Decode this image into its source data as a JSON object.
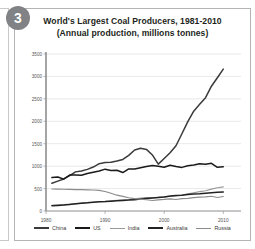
{
  "badge": {
    "number": "3"
  },
  "title": {
    "line1": "World's Largest Coal Producers, 1981-2010",
    "line2": "(Annual production, millions tonnes)"
  },
  "chart_data": {
    "type": "line",
    "title": "World's Largest Coal Producers, 1981-2010",
    "subtitle": "(Annual production, millions tonnes)",
    "xlabel": "",
    "ylabel": "",
    "xlim": [
      1980,
      2013
    ],
    "ylim": [
      0,
      3500
    ],
    "grid": true,
    "legend_position": "bottom",
    "xticks": [
      1980,
      1990,
      2000,
      2010
    ],
    "xtick_labels": [
      "1980",
      "1990",
      "2000",
      "2010"
    ],
    "yticks": [
      0,
      500,
      1000,
      1500,
      2000,
      2500,
      3000,
      3500
    ],
    "ytick_labels": [
      "0",
      "500",
      "1000",
      "1500",
      "2000",
      "2500",
      "3000",
      "3500"
    ],
    "x": [
      1981,
      1982,
      1983,
      1984,
      1985,
      1986,
      1987,
      1988,
      1989,
      1990,
      1991,
      1992,
      1993,
      1994,
      1995,
      1996,
      1997,
      1998,
      1999,
      2000,
      2001,
      2002,
      2003,
      2004,
      2005,
      2006,
      2007,
      2008,
      2009,
      2010
    ],
    "series": [
      {
        "name": "China",
        "color": "#3a3a3a",
        "width": 1.5,
        "values": [
          620,
          666,
          715,
          789,
          872,
          894,
          928,
          980,
          1054,
          1080,
          1087,
          1116,
          1150,
          1240,
          1361,
          1397,
          1373,
          1250,
          1045,
          1171,
          1300,
          1455,
          1722,
          1992,
          2226,
          2380,
          2526,
          2782,
          2971,
          3162
        ]
      },
      {
        "name": "US",
        "color": "#1a1a1a",
        "width": 1.5,
        "values": [
          745,
          757,
          710,
          801,
          801,
          797,
          834,
          862,
          890,
          933,
          904,
          907,
          857,
          938,
          937,
          964,
          990,
          1012,
          1000,
          974,
          1021,
          991,
          972,
          1008,
          1027,
          1053,
          1040,
          1063,
          975,
          984
        ]
      },
      {
        "name": "India",
        "color": "#9a9a9a",
        "width": 1.2,
        "values": [
          128,
          135,
          144,
          152,
          161,
          176,
          187,
          195,
          206,
          211,
          226,
          240,
          248,
          256,
          273,
          286,
          299,
          296,
          302,
          313,
          323,
          336,
          356,
          383,
          407,
          430,
          452,
          489,
          519,
          538
        ]
      },
      {
        "name": "Australia",
        "color": "#222222",
        "width": 1.5,
        "values": [
          116,
          124,
          132,
          146,
          164,
          174,
          182,
          196,
          205,
          210,
          220,
          229,
          236,
          243,
          253,
          266,
          279,
          290,
          303,
          313,
          335,
          346,
          351,
          366,
          378,
          383,
          394,
          405,
          419,
          424
        ]
      },
      {
        "name": "Russia",
        "color": "#8c8c8c",
        "width": 1.2,
        "values": [
          490,
          488,
          485,
          482,
          478,
          475,
          472,
          468,
          460,
          434,
          395,
          352,
          326,
          295,
          276,
          265,
          251,
          234,
          250,
          258,
          270,
          256,
          277,
          283,
          299,
          310,
          316,
          329,
          301,
          323
        ]
      }
    ]
  },
  "legend": {
    "items": [
      {
        "label": "China",
        "color": "#3a3a3a",
        "width": 2.2
      },
      {
        "label": "US",
        "color": "#1a1a1a",
        "width": 2.2
      },
      {
        "label": "India",
        "color": "#9a9a9a",
        "width": 1.2
      },
      {
        "label": "Australia",
        "color": "#222222",
        "width": 2.2
      },
      {
        "label": "Russia",
        "color": "#8c8c8c",
        "width": 1.2
      }
    ]
  }
}
